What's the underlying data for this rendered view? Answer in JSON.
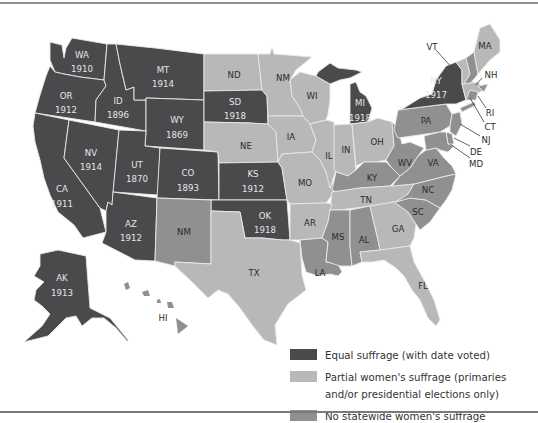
{
  "map": {
    "title": "Women's suffrage in the United States before the 19th Amendment",
    "legend": [
      {
        "key": "equal",
        "label": "Equal suffrage (with date voted)",
        "color": "#4a4a4c"
      },
      {
        "key": "partial",
        "label": "Partial women's suffrage (primaries and/or presidential elections only)",
        "color": "#b8b8b8"
      },
      {
        "key": "none",
        "label": "No statewide women's suffrage",
        "color": "#909090"
      }
    ],
    "states": {
      "WA": {
        "label": "WA",
        "year": "1910",
        "status": "equal"
      },
      "OR": {
        "label": "OR",
        "year": "1912",
        "status": "equal"
      },
      "CA": {
        "label": "CA",
        "year": "1911",
        "status": "equal"
      },
      "ID": {
        "label": "ID",
        "year": "1896",
        "status": "equal"
      },
      "NV": {
        "label": "NV",
        "year": "1914",
        "status": "equal"
      },
      "MT": {
        "label": "MT",
        "year": "1914",
        "status": "equal"
      },
      "WY": {
        "label": "WY",
        "year": "1869",
        "status": "equal"
      },
      "UT": {
        "label": "UT",
        "year": "1870",
        "status": "equal"
      },
      "CO": {
        "label": "CO",
        "year": "1893",
        "status": "equal"
      },
      "AZ": {
        "label": "AZ",
        "year": "1912",
        "status": "equal"
      },
      "SD": {
        "label": "SD",
        "year": "1918",
        "status": "equal"
      },
      "KS": {
        "label": "KS",
        "year": "1912",
        "status": "equal"
      },
      "OK": {
        "label": "OK",
        "year": "1918",
        "status": "equal"
      },
      "MI": {
        "label": "MI",
        "year": "1918",
        "status": "equal"
      },
      "NY": {
        "label": "NY",
        "year": "1917",
        "status": "equal"
      },
      "AK": {
        "label": "AK",
        "year": "1913",
        "status": "equal"
      },
      "ND": {
        "label": "ND",
        "status": "partial"
      },
      "MN": {
        "label": "NM",
        "status": "partial"
      },
      "NE": {
        "label": "NE",
        "status": "partial"
      },
      "IA": {
        "label": "IA",
        "status": "partial"
      },
      "WI": {
        "label": "WI",
        "status": "partial"
      },
      "IL": {
        "label": "IL",
        "status": "partial"
      },
      "IN": {
        "label": "IN",
        "status": "partial"
      },
      "OH": {
        "label": "OH",
        "status": "partial"
      },
      "MO": {
        "label": "MO",
        "status": "partial"
      },
      "AR": {
        "label": "AR",
        "status": "partial"
      },
      "TN": {
        "label": "TN",
        "status": "partial"
      },
      "TX": {
        "label": "TX",
        "status": "partial"
      },
      "GA": {
        "label": "GA",
        "status": "partial"
      },
      "FL": {
        "label": "FL",
        "status": "partial"
      },
      "MA": {
        "label": "MA",
        "status": "partial"
      },
      "VT": {
        "label": "VT",
        "status": "partial"
      },
      "RI": {
        "label": "RI",
        "status": "partial"
      },
      "NM": {
        "label": "NM",
        "status": "none"
      },
      "PA": {
        "label": "PA",
        "status": "none"
      },
      "KY": {
        "label": "KY",
        "status": "none"
      },
      "WV": {
        "label": "WV",
        "status": "none"
      },
      "VA": {
        "label": "VA",
        "status": "none"
      },
      "NC": {
        "label": "NC",
        "status": "none"
      },
      "SC": {
        "label": "SC",
        "status": "none"
      },
      "MS": {
        "label": "MS",
        "status": "none"
      },
      "AL": {
        "label": "AL",
        "status": "none"
      },
      "LA": {
        "label": "LA",
        "status": "none"
      },
      "NH": {
        "label": "NH",
        "status": "none"
      },
      "CT": {
        "label": "CT",
        "status": "none"
      },
      "NJ": {
        "label": "NJ",
        "status": "none"
      },
      "DE": {
        "label": "DE",
        "status": "none"
      },
      "MD": {
        "label": "MD",
        "status": "none"
      },
      "HI": {
        "label": "HI",
        "status": "none"
      }
    }
  }
}
